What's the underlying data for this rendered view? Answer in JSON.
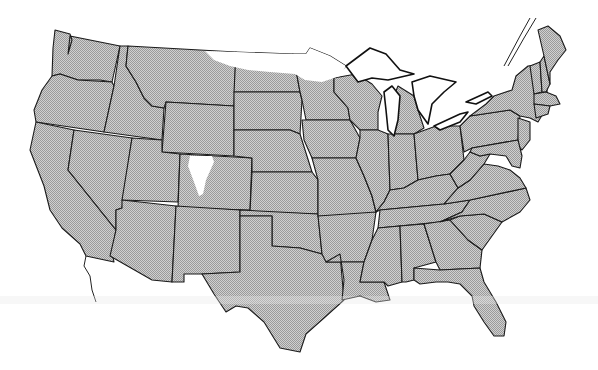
{
  "map": {
    "title": "",
    "subject": "Contiguous United States",
    "fill_color": "#c8c8c8",
    "stipple_dark": "#9a9a9a",
    "outline_color": "#1a1a1a",
    "unshaded_color": "#ffffff",
    "legend": [],
    "labels": [],
    "shaded_description": "All states stippled gray except unshaded (white) areas",
    "unshaded_regions": [
      {
        "name": "northern-plains",
        "states": [
          "Montana (northeast)",
          "North Dakota (north)",
          "Minnesota (northwest)"
        ]
      },
      {
        "name": "colorado-mountains",
        "states": [
          "Colorado (west-central)"
        ]
      }
    ]
  }
}
